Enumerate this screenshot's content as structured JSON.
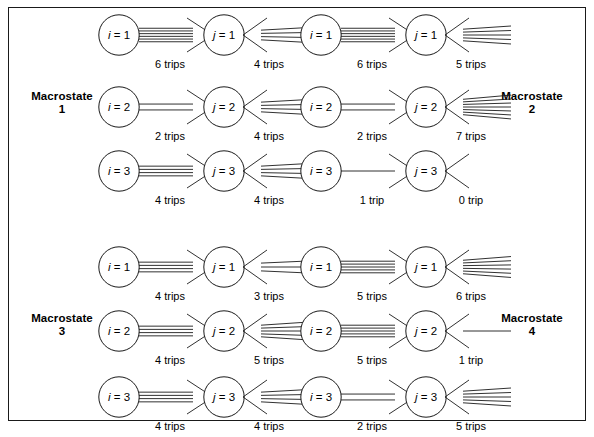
{
  "figure": {
    "width": 594,
    "height": 437,
    "line_color": "#1a1a1a",
    "background": "#ffffff"
  },
  "macrostate_labels": [
    {
      "name": "Macrostate",
      "number": "1",
      "side": "left",
      "row_band": "top"
    },
    {
      "name": "Macrostate",
      "number": "2",
      "side": "right",
      "row_band": "top"
    },
    {
      "name": "Macrostate",
      "number": "3",
      "side": "left",
      "row_band": "bottom"
    },
    {
      "name": "Macrostate",
      "number": "4",
      "side": "right",
      "row_band": "bottom"
    }
  ],
  "columns": [
    {
      "index": 0,
      "node_symbol": "i",
      "direction": "out",
      "x": 98
    },
    {
      "index": 1,
      "node_symbol": "j",
      "direction": "in",
      "x": 203
    },
    {
      "index": 2,
      "node_symbol": "i",
      "direction": "out",
      "x": 300
    },
    {
      "index": 3,
      "node_symbol": "j",
      "direction": "in",
      "x": 405
    }
  ],
  "rows": [
    {
      "index": 0,
      "band": "top",
      "y": 14
    },
    {
      "index": 1,
      "band": "top",
      "y": 86
    },
    {
      "index": 2,
      "band": "top",
      "y": 150
    },
    {
      "index": 3,
      "band": "bottom",
      "y": 246
    },
    {
      "index": 4,
      "band": "bottom",
      "y": 310
    },
    {
      "index": 5,
      "band": "bottom",
      "y": 376
    }
  ],
  "units": [
    {
      "id": "u00",
      "col": 0,
      "row": 0,
      "symbol": "i",
      "index": "1",
      "direction": "out",
      "trips": 6,
      "trip_label": "6 trips"
    },
    {
      "id": "u10",
      "col": 1,
      "row": 0,
      "symbol": "j",
      "index": "1",
      "direction": "in",
      "trips": 4,
      "trip_label": "4 trips"
    },
    {
      "id": "u20",
      "col": 2,
      "row": 0,
      "symbol": "i",
      "index": "1",
      "direction": "out",
      "trips": 6,
      "trip_label": "6 trips"
    },
    {
      "id": "u30",
      "col": 3,
      "row": 0,
      "symbol": "j",
      "index": "1",
      "direction": "in",
      "trips": 5,
      "trip_label": "5 trips"
    },
    {
      "id": "u01",
      "col": 0,
      "row": 1,
      "symbol": "i",
      "index": "2",
      "direction": "out",
      "trips": 2,
      "trip_label": "2 trips"
    },
    {
      "id": "u11",
      "col": 1,
      "row": 1,
      "symbol": "j",
      "index": "2",
      "direction": "in",
      "trips": 4,
      "trip_label": "4 trips"
    },
    {
      "id": "u21",
      "col": 2,
      "row": 1,
      "symbol": "i",
      "index": "2",
      "direction": "out",
      "trips": 2,
      "trip_label": "2 trips"
    },
    {
      "id": "u31",
      "col": 3,
      "row": 1,
      "symbol": "j",
      "index": "2",
      "direction": "in",
      "trips": 7,
      "trip_label": "7 trips"
    },
    {
      "id": "u02",
      "col": 0,
      "row": 2,
      "symbol": "i",
      "index": "3",
      "direction": "out",
      "trips": 4,
      "trip_label": "4 trips"
    },
    {
      "id": "u12",
      "col": 1,
      "row": 2,
      "symbol": "j",
      "index": "3",
      "direction": "in",
      "trips": 4,
      "trip_label": "4 trips"
    },
    {
      "id": "u22",
      "col": 2,
      "row": 2,
      "symbol": "i",
      "index": "3",
      "direction": "out",
      "trips": 1,
      "trip_label": "1 trip"
    },
    {
      "id": "u32",
      "col": 3,
      "row": 2,
      "symbol": "j",
      "index": "3",
      "direction": "in",
      "trips": 0,
      "trip_label": "0 trip"
    },
    {
      "id": "u03",
      "col": 0,
      "row": 3,
      "symbol": "i",
      "index": "1",
      "direction": "out",
      "trips": 4,
      "trip_label": "4 trips"
    },
    {
      "id": "u13",
      "col": 1,
      "row": 3,
      "symbol": "j",
      "index": "1",
      "direction": "in",
      "trips": 3,
      "trip_label": "3 trips"
    },
    {
      "id": "u23",
      "col": 2,
      "row": 3,
      "symbol": "i",
      "index": "1",
      "direction": "out",
      "trips": 5,
      "trip_label": "5 trips"
    },
    {
      "id": "u33",
      "col": 3,
      "row": 3,
      "symbol": "j",
      "index": "1",
      "direction": "in",
      "trips": 6,
      "trip_label": "6 trips"
    },
    {
      "id": "u04",
      "col": 0,
      "row": 4,
      "symbol": "i",
      "index": "2",
      "direction": "out",
      "trips": 4,
      "trip_label": "4 trips"
    },
    {
      "id": "u14",
      "col": 1,
      "row": 4,
      "symbol": "j",
      "index": "2",
      "direction": "in",
      "trips": 5,
      "trip_label": "5 trips"
    },
    {
      "id": "u24",
      "col": 2,
      "row": 4,
      "symbol": "i",
      "index": "2",
      "direction": "out",
      "trips": 5,
      "trip_label": "5 trips"
    },
    {
      "id": "u34",
      "col": 3,
      "row": 4,
      "symbol": "j",
      "index": "2",
      "direction": "in",
      "trips": 1,
      "trip_label": "1 trip"
    },
    {
      "id": "u05",
      "col": 0,
      "row": 5,
      "symbol": "i",
      "index": "3",
      "direction": "out",
      "trips": 4,
      "trip_label": "4 trips"
    },
    {
      "id": "u15",
      "col": 1,
      "row": 5,
      "symbol": "j",
      "index": "3",
      "direction": "in",
      "trips": 4,
      "trip_label": "4 trips"
    },
    {
      "id": "u25",
      "col": 2,
      "row": 5,
      "symbol": "i",
      "index": "3",
      "direction": "out",
      "trips": 2,
      "trip_label": "2 trips"
    },
    {
      "id": "u35",
      "col": 3,
      "row": 5,
      "symbol": "j",
      "index": "3",
      "direction": "in",
      "trips": 5,
      "trip_label": "5 trips"
    }
  ],
  "equals_sign": "=",
  "geometry": {
    "circle_d": 42,
    "shaft_len": 52,
    "head_len": 22,
    "head_half": 17,
    "fan_half": 12
  }
}
